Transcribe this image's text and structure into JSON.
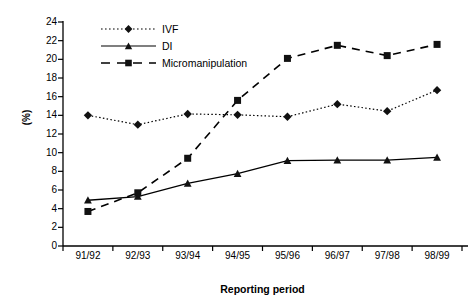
{
  "chart_data": {
    "type": "line",
    "title": "",
    "xlabel": "Reporting period",
    "ylabel": "(%)",
    "categories": [
      "91/92",
      "92/93",
      "93/94",
      "94/95",
      "95/96",
      "96/97",
      "97/98",
      "98/99"
    ],
    "ylim": [
      0,
      24
    ],
    "y_ticks": [
      0,
      2,
      4,
      6,
      8,
      10,
      12,
      14,
      16,
      18,
      20,
      22,
      24
    ],
    "y_tick_labels": [
      "0",
      "2",
      "4",
      "6",
      "8",
      "10",
      "12",
      "14",
      "16",
      "18",
      "20",
      "22",
      "24"
    ],
    "grid": false,
    "legend_position": "top-left",
    "series": [
      {
        "name": "IVF",
        "values": [
          14.0,
          13.0,
          14.15,
          14.05,
          13.85,
          15.2,
          14.45,
          16.7
        ],
        "marker": "diamond",
        "line_style": "dotted",
        "color": "#000000"
      },
      {
        "name": "DI",
        "values": [
          4.9,
          5.3,
          6.7,
          7.75,
          9.15,
          9.2,
          9.2,
          9.5
        ],
        "marker": "triangle",
        "line_style": "solid",
        "color": "#000000"
      },
      {
        "name": "Micromanipulation",
        "values": [
          3.7,
          5.7,
          9.4,
          15.6,
          20.1,
          21.5,
          20.4,
          21.6
        ],
        "marker": "square",
        "line_style": "dashed",
        "color": "#000000"
      }
    ]
  },
  "legend": {
    "items": [
      {
        "label": "IVF"
      },
      {
        "label": "DI"
      },
      {
        "label": "Micromanipulation"
      }
    ]
  },
  "axes": {
    "x_title": "Reporting period",
    "y_title": "(%)"
  }
}
